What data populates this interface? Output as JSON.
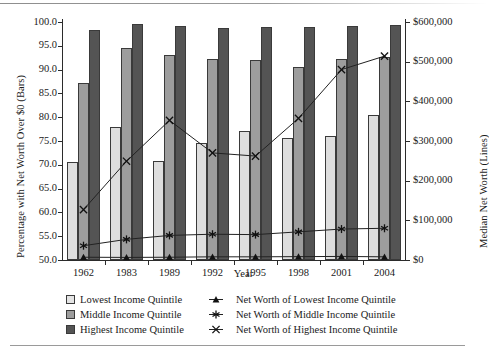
{
  "chart_data": {
    "type": "bar",
    "title": "",
    "xlabel": "Year",
    "ylabel": "Percentage with Net Worth Over $0 (Bars)",
    "ylabel_right": "Median Net Worth (Lines)",
    "categories": [
      "1962",
      "1983",
      "1989",
      "1992",
      "1995",
      "1998",
      "2001",
      "2004"
    ],
    "ylim": [
      50.0,
      100.0
    ],
    "yticks": [
      "50.0",
      "55.0",
      "60.0",
      "65.0",
      "70.0",
      "75.0",
      "80.0",
      "85.0",
      "90.0",
      "95.0",
      "100.0"
    ],
    "ytick_values": [
      50.0,
      55.0,
      60.0,
      65.0,
      70.0,
      75.0,
      80.0,
      85.0,
      90.0,
      95.0,
      100.0
    ],
    "ylim_right": [
      0,
      600000
    ],
    "yticks_right": [
      "$0",
      "$100,000",
      "$200,000",
      "$300,000",
      "$400,000",
      "$500,000",
      "$600,000"
    ],
    "ytick_values_right": [
      0,
      100000,
      200000,
      300000,
      400000,
      500000,
      600000
    ],
    "grid": false,
    "legend_position": "bottom",
    "bar_series": [
      {
        "name": "Lowest Income Quintile",
        "marker": "square-light",
        "color": "#dedede",
        "axis": "left",
        "values": [
          70.6,
          78.0,
          70.8,
          74.5,
          77.2,
          75.6,
          76.1,
          80.4
        ]
      },
      {
        "name": "Middle Income Quintile",
        "marker": "square-medium",
        "color": "#9d9d9d",
        "axis": "left",
        "values": [
          87.1,
          94.6,
          93.1,
          92.3,
          92.1,
          90.5,
          92.2,
          92.6
        ]
      },
      {
        "name": "Highest Income Quintile",
        "marker": "square-dark",
        "color": "#545454",
        "axis": "left",
        "values": [
          98.3,
          99.5,
          99.1,
          98.8,
          99.0,
          99.0,
          99.2,
          99.3
        ]
      }
    ],
    "line_series": [
      {
        "name": "Net Worth of Lowest Income Quintile",
        "marker": "triangle",
        "axis": "right",
        "values": [
          7000,
          6500,
          7000,
          8000,
          8000,
          8500,
          9000,
          8000
        ]
      },
      {
        "name": "Net Worth of Middle Income Quintile",
        "marker": "asterisk",
        "axis": "right",
        "values": [
          36000,
          52000,
          62000,
          65000,
          64000,
          71000,
          78000,
          80000
        ]
      },
      {
        "name": "Net Worth of Highest Income Quintile",
        "marker": "cross",
        "axis": "right",
        "values": [
          127000,
          249000,
          352000,
          270000,
          262000,
          357000,
          480000,
          514000
        ]
      }
    ]
  },
  "legend": {
    "bars": [
      {
        "label": "Lowest Income Quintile",
        "swatch": "square-light-icon"
      },
      {
        "label": "Middle Income Quintile",
        "swatch": "square-medium-icon"
      },
      {
        "label": "Highest Income Quintile",
        "swatch": "square-dark-icon"
      }
    ],
    "lines": [
      {
        "label": "Net Worth of Lowest Income Quintile",
        "marker": "triangle-marker-icon"
      },
      {
        "label": "Net Worth of Middle Income Quintile",
        "marker": "asterisk-marker-icon"
      },
      {
        "label": "Net Worth of Highest Income Quintile",
        "marker": "cross-marker-icon"
      }
    ]
  },
  "colors": {
    "lowest": "#dedede",
    "middle": "#9d9d9d",
    "highest": "#545454",
    "axis": "#2b2b2b",
    "line": "#222222"
  }
}
